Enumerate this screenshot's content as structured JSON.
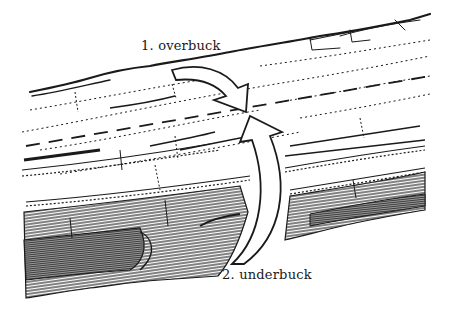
{
  "figure": {
    "labels": {
      "overbuck": "1. overbuck",
      "underbuck": "2. underbuck"
    },
    "elements": {
      "log": "log-illustration",
      "cut_line": "dashed-cut-line",
      "arrow_1": "curved-arrow-down",
      "arrow_2": "curved-arrow-up"
    },
    "colors": {
      "ink": "#1a1a1a",
      "paper": "#ffffff"
    }
  }
}
